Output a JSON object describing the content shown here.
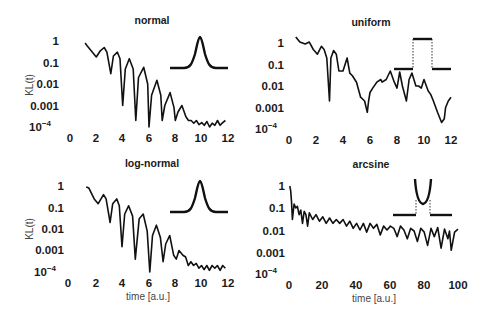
{
  "figure": {
    "ylabel": "KL(t)",
    "xlabel": "time [a.u.]"
  },
  "chart_data": [
    {
      "id": "normal",
      "type": "line",
      "title": "normal",
      "xlabel": "",
      "ylabel": "KL(t)",
      "yscale": "log",
      "ylim": [
        0.0001,
        1
      ],
      "xlim": [
        0,
        12
      ],
      "xticks": [
        "0",
        "2",
        "4",
        "6",
        "8",
        "10",
        "12"
      ],
      "yticks": [
        "1",
        "0.1",
        "0.01",
        "0.001",
        "10^-4"
      ],
      "inset": "gaussian",
      "series": [
        {
          "name": "KL(t)",
          "x": [
            1.15,
            1.3,
            1.7,
            2.0,
            2.3,
            2.6,
            2.8,
            3.1,
            3.3,
            3.6,
            3.8,
            4.0,
            4.2,
            4.5,
            4.8,
            5.0,
            5.2,
            5.6,
            5.9,
            6.0,
            6.2,
            6.6,
            6.9,
            7.0,
            7.2,
            7.6,
            7.9,
            8.0,
            8.2,
            8.5,
            8.8,
            9.0,
            9.2,
            9.4,
            9.6,
            9.8,
            10.0,
            10.2,
            10.4,
            10.6,
            10.8,
            11.0,
            11.2,
            11.4,
            11.6,
            11.8
          ],
          "values": [
            0.8,
            0.6,
            0.3,
            0.18,
            0.35,
            0.5,
            0.3,
            0.03,
            0.2,
            0.3,
            0.15,
            0.001,
            0.05,
            0.15,
            0.05,
            0.0002,
            0.02,
            0.06,
            0.01,
            0.0001,
            0.003,
            0.015,
            0.003,
            0.0002,
            0.001,
            0.004,
            0.0008,
            0.0002,
            0.0005,
            0.001,
            0.0003,
            0.0002,
            0.0002,
            0.00015,
            0.0002,
            0.00013,
            0.00016,
            0.00012,
            0.00018,
            0.0001,
            0.00015,
            0.00012,
            0.0002,
            0.00012,
            0.00016,
            0.0002
          ]
        }
      ]
    },
    {
      "id": "uniform",
      "type": "line",
      "title": "uniform",
      "yscale": "log",
      "ylim": [
        0.0001,
        1
      ],
      "xlim": [
        0,
        12
      ],
      "xticks": [
        "0",
        "2",
        "4",
        "6",
        "8",
        "10",
        "12"
      ],
      "yticks": [
        "1",
        "0.1",
        "0.01",
        "0.001",
        "10^-4"
      ],
      "inset": "rectangle",
      "series": [
        {
          "name": "KL(t)",
          "x": [
            0.5,
            0.8,
            1.2,
            1.5,
            1.8,
            2.1,
            2.4,
            2.6,
            2.8,
            3.0,
            3.1,
            3.3,
            3.5,
            3.7,
            4.0,
            4.3,
            4.5,
            4.7,
            5.0,
            5.3,
            5.6,
            5.8,
            5.9,
            6.0,
            6.2,
            6.5,
            6.8,
            6.9,
            7.2,
            7.5,
            7.8,
            8.0,
            8.2,
            8.4,
            8.7,
            8.9,
            9.1,
            9.4,
            9.6,
            9.8,
            10.0,
            10.3,
            10.5,
            10.7,
            11.0,
            11.3,
            11.5,
            11.6,
            11.8,
            12.0
          ],
          "values": [
            1.9,
            1.1,
            0.9,
            1.1,
            0.5,
            0.3,
            0.7,
            0.5,
            0.2,
            0.002,
            0.2,
            0.45,
            0.3,
            0.05,
            0.05,
            0.2,
            0.04,
            0.03,
            0.015,
            0.003,
            0.002,
            0.0006,
            0.002,
            0.005,
            0.008,
            0.015,
            0.02,
            0.015,
            0.02,
            0.05,
            0.015,
            0.008,
            0.045,
            0.01,
            0.002,
            0.02,
            0.04,
            0.01,
            0.01,
            0.008,
            0.02,
            0.006,
            0.004,
            0.002,
            0.0006,
            0.0002,
            0.0003,
            0.001,
            0.002,
            0.003
          ]
        }
      ]
    },
    {
      "id": "log-normal",
      "type": "line",
      "title": "log-normal",
      "xlabel": "time [a.u.]",
      "ylabel": "KL(t)",
      "yscale": "log",
      "ylim": [
        0.0001,
        1
      ],
      "xlim": [
        0,
        12
      ],
      "xticks": [
        "0",
        "2",
        "4",
        "6",
        "8",
        "10",
        "12"
      ],
      "yticks": [
        "1",
        "0.1",
        "0.01",
        "0.001",
        "10^-4"
      ],
      "inset": "gaussian",
      "series": [
        {
          "name": "KL(t)",
          "x": [
            1.3,
            1.5,
            1.9,
            2.2,
            2.6,
            2.8,
            3.1,
            3.3,
            3.6,
            3.8,
            4.0,
            4.2,
            4.5,
            4.8,
            5.0,
            5.3,
            5.6,
            5.9,
            6.1,
            6.3,
            6.6,
            6.9,
            7.1,
            7.3,
            7.6,
            7.9,
            8.1,
            8.3,
            8.6,
            8.8,
            9.0,
            9.2,
            9.4,
            9.6,
            9.8,
            10.0,
            10.2,
            10.4,
            10.6,
            10.8,
            11.0,
            11.2,
            11.4,
            11.6,
            11.8
          ],
          "values": [
            0.9,
            0.8,
            0.25,
            0.15,
            0.4,
            0.25,
            0.02,
            0.15,
            0.25,
            0.12,
            0.0015,
            0.05,
            0.12,
            0.04,
            0.0004,
            0.03,
            0.05,
            0.008,
            0.0001,
            0.005,
            0.015,
            0.004,
            0.0003,
            0.002,
            0.005,
            0.0006,
            0.0004,
            0.001,
            0.0006,
            0.0005,
            0.0002,
            0.0003,
            0.0002,
            0.00025,
            0.00015,
            0.0002,
            0.00013,
            0.0002,
            0.00012,
            0.0002,
            0.00015,
            0.0002,
            0.00012,
            0.0002,
            0.00015
          ]
        }
      ]
    },
    {
      "id": "arcsine",
      "type": "line",
      "title": "arcsine",
      "xlabel": "time [a.u.]",
      "yscale": "log",
      "ylim": [
        0.0001,
        1
      ],
      "xlim": [
        0,
        100
      ],
      "xticks": [
        "0",
        "20",
        "40",
        "60",
        "80",
        "100"
      ],
      "yticks": [
        "1",
        "0.1",
        "0.01",
        "0.001",
        "10^-4"
      ],
      "inset": "arcsine",
      "series": [
        {
          "name": "KL(t)",
          "x": [
            0.5,
            1,
            1.5,
            2,
            3,
            4,
            5,
            6,
            7,
            8,
            9,
            10,
            11,
            12,
            14,
            16,
            18,
            20,
            22,
            24,
            26,
            28,
            30,
            32,
            34,
            36,
            38,
            40,
            42,
            44,
            46,
            48,
            50,
            52,
            54,
            56,
            58,
            60,
            62,
            64,
            66,
            68,
            70,
            72,
            74,
            76,
            78,
            80,
            82,
            84,
            86,
            88,
            90,
            92,
            94,
            95,
            96,
            98,
            100
          ],
          "values": [
            1,
            0.6,
            0.2,
            0.03,
            0.15,
            0.1,
            0.12,
            0.05,
            0.08,
            0.02,
            0.07,
            0.05,
            0.015,
            0.06,
            0.03,
            0.05,
            0.025,
            0.04,
            0.02,
            0.035,
            0.02,
            0.03,
            0.02,
            0.03,
            0.015,
            0.025,
            0.012,
            0.02,
            0.01,
            0.02,
            0.008,
            0.02,
            0.012,
            0.018,
            0.006,
            0.015,
            0.01,
            0.015,
            0.012,
            0.005,
            0.015,
            0.01,
            0.004,
            0.012,
            0.009,
            0.003,
            0.012,
            0.008,
            0.002,
            0.012,
            0.005,
            0.013,
            0.0015,
            0.011,
            0.004,
            0.009,
            0.0012,
            0.008,
            0.011
          ]
        }
      ]
    }
  ]
}
